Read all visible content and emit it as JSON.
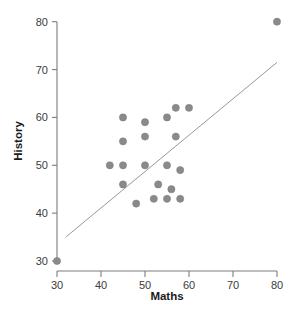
{
  "chart_data": {
    "type": "scatter",
    "title": "",
    "xlabel": "Maths",
    "ylabel": "History",
    "xlim": [
      27,
      83
    ],
    "ylim": [
      28,
      82
    ],
    "xticks": [
      30,
      40,
      50,
      60,
      70,
      80
    ],
    "yticks": [
      30,
      40,
      50,
      60,
      70,
      80
    ],
    "xtick_labels": [
      "30",
      "40",
      "50",
      "60",
      "70",
      "80"
    ],
    "ytick_labels": [
      "30",
      "40",
      "50",
      "60",
      "70",
      "80"
    ],
    "grid": false,
    "legend": "none",
    "marker": {
      "shape": "circle",
      "color": "#8a8a8a",
      "edge_color": "#7b7b7b",
      "size": 6
    },
    "points": [
      {
        "x": 30,
        "y": 30
      },
      {
        "x": 42,
        "y": 50
      },
      {
        "x": 45,
        "y": 60
      },
      {
        "x": 45,
        "y": 55
      },
      {
        "x": 45,
        "y": 50
      },
      {
        "x": 45,
        "y": 46
      },
      {
        "x": 48,
        "y": 42
      },
      {
        "x": 50,
        "y": 59
      },
      {
        "x": 50,
        "y": 56
      },
      {
        "x": 50,
        "y": 50
      },
      {
        "x": 52,
        "y": 43
      },
      {
        "x": 53,
        "y": 46
      },
      {
        "x": 55,
        "y": 60
      },
      {
        "x": 55,
        "y": 50
      },
      {
        "x": 55,
        "y": 43
      },
      {
        "x": 56,
        "y": 45
      },
      {
        "x": 57,
        "y": 62
      },
      {
        "x": 57,
        "y": 56
      },
      {
        "x": 58,
        "y": 49
      },
      {
        "x": 58,
        "y": 43
      },
      {
        "x": 60,
        "y": 62
      },
      {
        "x": 80,
        "y": 80
      }
    ],
    "fit_line": {
      "type": "linear-trend",
      "color": "#8c8c8c",
      "x_start": 32,
      "y_start": 35,
      "x_end": 80,
      "y_end": 71.5
    }
  }
}
